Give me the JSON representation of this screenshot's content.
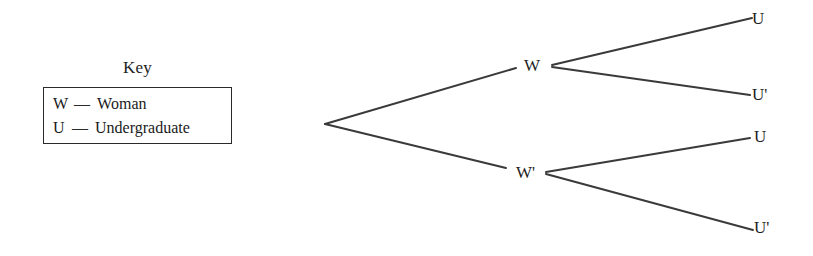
{
  "figure": {
    "type": "probability-tree-diagram",
    "background_color": "#ffffff",
    "line_color": "#3a3a3a"
  },
  "key": {
    "title": "Key",
    "entries": [
      {
        "symbol": "W",
        "dash": "—",
        "term": "Woman"
      },
      {
        "symbol": "U",
        "dash": "—",
        "term": "Undergraduate"
      }
    ]
  },
  "tree": {
    "root": {
      "label": "",
      "x": 325,
      "y": 124
    },
    "level1": [
      {
        "id": "w",
        "label": "W",
        "x": 550,
        "y": 65
      },
      {
        "id": "wp",
        "label": "W'",
        "x": 545,
        "y": 173
      }
    ],
    "level2": [
      {
        "id": "u1",
        "label": "U",
        "parent": "w",
        "x": 752,
        "y": 18
      },
      {
        "id": "up1",
        "label": "U'",
        "parent": "w",
        "x": 750,
        "y": 95
      },
      {
        "id": "u2",
        "label": "U",
        "parent": "wp",
        "x": 750,
        "y": 138
      },
      {
        "id": "up2",
        "label": "U'",
        "parent": "wp",
        "x": 753,
        "y": 230
      }
    ],
    "branches": [
      {
        "from": "root",
        "to": "w",
        "x1": 325,
        "y1": 124,
        "x2": 516,
        "y2": 68
      },
      {
        "from": "root",
        "to": "wp",
        "x1": 325,
        "y1": 124,
        "x2": 506,
        "y2": 168
      },
      {
        "from": "w",
        "to": "u1",
        "x1": 552,
        "y1": 65,
        "x2": 752,
        "y2": 18
      },
      {
        "from": "w",
        "to": "up1",
        "x1": 552,
        "y1": 67,
        "x2": 750,
        "y2": 95
      },
      {
        "from": "wp",
        "to": "u2",
        "x1": 546,
        "y1": 172,
        "x2": 750,
        "y2": 138
      },
      {
        "from": "wp",
        "to": "up2",
        "x1": 546,
        "y1": 174,
        "x2": 753,
        "y2": 230
      }
    ]
  }
}
